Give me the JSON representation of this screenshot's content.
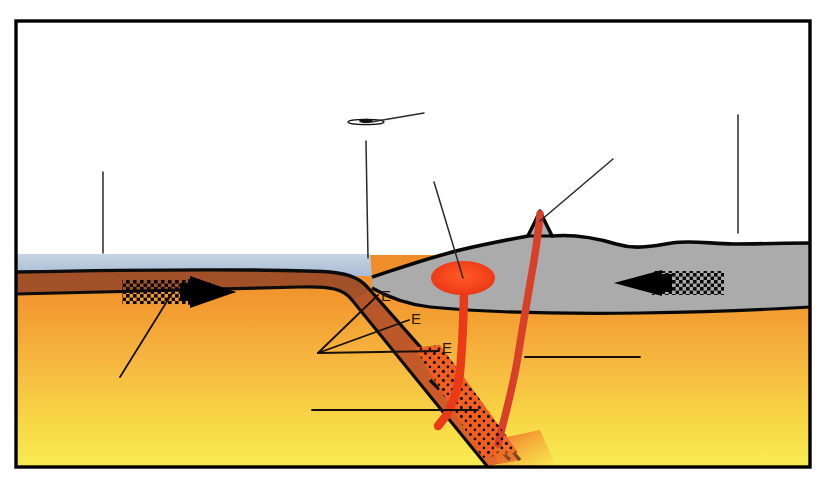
{
  "figure": {
    "frame_color": "#000000",
    "background_color": "#ffffff"
  },
  "palette": {
    "sky": "#ffffff",
    "ocean_water": "#b9c9dd",
    "oceanic_crust": "#a8542a",
    "continental_crust": "#ababab",
    "mantle_top": "#f0912f",
    "mantle_mid": "#f6b23f",
    "mantle_bottom": "#f7e84c",
    "magma_red": "#e8341c",
    "magma_chamber": "#f4451f",
    "leader_line": "#1a1a1a",
    "arrow_black": "#000000",
    "outline_black": "#000000"
  },
  "labels": {
    "slab_markers": [
      {
        "id": "slab-marker-1",
        "text": "E",
        "x": 381,
        "y": 301
      },
      {
        "id": "slab-marker-2",
        "text": "E",
        "x": 411,
        "y": 324
      },
      {
        "id": "slab-marker-3",
        "text": "E",
        "x": 442,
        "y": 353
      }
    ]
  },
  "features": {
    "ocean": {
      "name": "ocean-water-layer"
    },
    "oceanic_plate": {
      "name": "subducting-oceanic-plate"
    },
    "continental_plate": {
      "name": "overriding-continental-plate"
    },
    "mantle": {
      "name": "mantle-asthenosphere"
    },
    "volcano": {
      "name": "volcano-peak"
    },
    "magma_chamber": {
      "name": "magma-chamber"
    },
    "conduit_left": {
      "name": "magma-conduit-left"
    },
    "conduit_right": {
      "name": "magma-conduit-right"
    },
    "melt_zone": {
      "name": "partial-melt-zone"
    },
    "trench_mark": {
      "name": "trench-marker"
    }
  },
  "arrows": {
    "left": {
      "name": "plate-motion-arrow-left",
      "direction": "right",
      "tail_pattern": "checkered"
    },
    "right": {
      "name": "plate-motion-arrow-right",
      "direction": "left",
      "tail_pattern": "checkered"
    }
  },
  "leader_lines": [
    {
      "id": "leader-ocean-left",
      "x1": 103,
      "y1": 172,
      "x2": 103,
      "y2": 253
    },
    {
      "id": "leader-trench",
      "x1": 366,
      "y1": 141,
      "x2": 368,
      "y2": 258
    },
    {
      "id": "leader-trench-diagonal",
      "x1": 424,
      "y1": 113,
      "x2": 371,
      "y2": 122
    },
    {
      "id": "leader-magma-chamber",
      "x1": 434,
      "y1": 182,
      "x2": 463,
      "y2": 278
    },
    {
      "id": "leader-volcano",
      "x1": 613,
      "y1": 159,
      "x2": 540,
      "y2": 221
    },
    {
      "id": "leader-continent-right",
      "x1": 738,
      "y1": 115,
      "x2": 738,
      "y2": 233
    },
    {
      "id": "leader-plate-left",
      "x1": 174,
      "y1": 290,
      "x2": 120,
      "y2": 377
    },
    {
      "id": "leader-e-fan-1",
      "x1": 318,
      "y1": 353,
      "x2": 378,
      "y2": 295
    },
    {
      "id": "leader-e-fan-2",
      "x1": 318,
      "y1": 353,
      "x2": 409,
      "y2": 320
    },
    {
      "id": "leader-e-fan-3",
      "x1": 318,
      "y1": 353,
      "x2": 439,
      "y2": 351
    },
    {
      "id": "leader-mantle-right",
      "x1": 525,
      "y1": 357,
      "x2": 640,
      "y2": 357
    },
    {
      "id": "leader-deep-slab",
      "x1": 312,
      "y1": 410,
      "x2": 478,
      "y2": 410
    }
  ]
}
